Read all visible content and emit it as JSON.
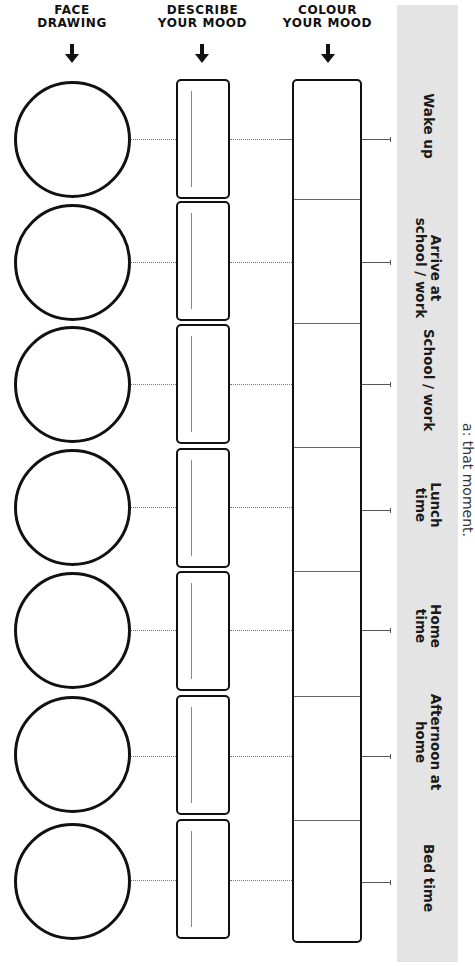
{
  "headers": {
    "face": "FACE\nDRAWING",
    "describe": "DESCRIBE\nYOUR MOOD",
    "colour": "COLOUR\nYOUR MOOD"
  },
  "rows": [
    {
      "label": "Wake up",
      "y": 139
    },
    {
      "label": "Arrive at\nschool / work",
      "y": 262
    },
    {
      "label": "School / work",
      "y": 384
    },
    {
      "label": "Lunch\ntime",
      "y": 507
    },
    {
      "label": "Home\ntime",
      "y": 630
    },
    {
      "label": "Afternoon at\nhome",
      "y": 756
    },
    {
      "label": "Bed time",
      "y": 880
    }
  ],
  "side_note": "a: that moment.",
  "colors": {
    "ink": "#111111",
    "panel": "#e4e4e4",
    "background": "#ffffff"
  }
}
